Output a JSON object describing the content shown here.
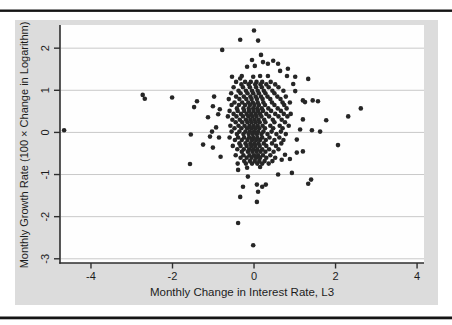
{
  "chart_data": {
    "type": "scatter",
    "title": "",
    "xlabel": "Monthly Change in Interest Rate, L3",
    "ylabel": "Monthly Growth Rate (100 × Change in Logarithm)",
    "xlim": [
      -4.76,
      4.17
    ],
    "ylim": [
      -3.1,
      2.55
    ],
    "xticks": [
      -4,
      -2,
      0,
      2,
      4
    ],
    "yticks": [
      -3,
      -2,
      -1,
      0,
      1,
      2
    ],
    "xtick_labels": [
      "-4",
      "-2",
      "0",
      "2",
      "4"
    ],
    "ytick_labels": [
      "-3",
      "-2",
      "-1",
      "0",
      "1",
      "2"
    ],
    "grid": "horizontal",
    "legend": "none",
    "colors": {
      "outer_bg": "#dcdcdc",
      "plot_bg": "#fefefe",
      "gridline": "#c9c9c9",
      "axis": "#2e2e2e",
      "marker": "#262626",
      "rule": "#141414",
      "text": "#1c1c1c"
    },
    "marker_radius": 2.3,
    "points": [
      [
        -4.66,
        0.05
      ],
      [
        -2.73,
        0.89
      ],
      [
        -2.68,
        0.8
      ],
      [
        -2.01,
        0.83
      ],
      [
        -1.57,
        -0.75
      ],
      [
        -1.55,
        -0.05
      ],
      [
        -1.47,
        0.6
      ],
      [
        -1.4,
        0.74
      ],
      [
        -1.25,
        -0.29
      ],
      [
        -1.13,
        0.36
      ],
      [
        -1.08,
        -0.1
      ],
      [
        -1.03,
        0.02
      ],
      [
        -1.01,
        -0.36
      ],
      [
        -1.01,
        0.62
      ],
      [
        -0.98,
        0.85
      ],
      [
        -0.93,
        0.12
      ],
      [
        -0.88,
        0.43
      ],
      [
        -0.86,
        -0.12
      ],
      [
        -0.84,
        0.55
      ],
      [
        -0.82,
        -0.58
      ],
      [
        0.0,
        2.42
      ],
      [
        -0.34,
        2.2
      ],
      [
        0.1,
        2.18
      ],
      [
        -0.78,
        1.96
      ],
      [
        0.17,
        1.84
      ],
      [
        -0.05,
        1.72
      ],
      [
        0.47,
        1.7
      ],
      [
        0.22,
        1.67
      ],
      [
        0.34,
        1.63
      ],
      [
        0.59,
        1.63
      ],
      [
        0.02,
        1.58
      ],
      [
        -0.17,
        1.56
      ],
      [
        0.83,
        1.51
      ],
      [
        0.64,
        1.46
      ],
      [
        -0.3,
        1.34
      ],
      [
        0.15,
        1.34
      ],
      [
        0.34,
        1.34
      ],
      [
        0.81,
        1.34
      ],
      [
        -0.54,
        1.32
      ],
      [
        -0.02,
        1.32
      ],
      [
        1.01,
        1.32
      ],
      [
        -0.34,
        1.28
      ],
      [
        1.33,
        1.27
      ],
      [
        0.96,
        1.15
      ],
      [
        1.2,
        0.76
      ],
      [
        1.44,
        0.76
      ],
      [
        1.57,
        0.74
      ],
      [
        1.25,
        0.72
      ],
      [
        1.01,
        0.98
      ],
      [
        1.2,
        0.31
      ],
      [
        1.77,
        0.29
      ],
      [
        2.31,
        0.38
      ],
      [
        2.62,
        0.57
      ],
      [
        1.13,
        0.07
      ],
      [
        1.42,
        0.05
      ],
      [
        1.62,
        0.02
      ],
      [
        1.05,
        -0.17
      ],
      [
        1.2,
        -0.45
      ],
      [
        1.05,
        -0.48
      ],
      [
        2.06,
        -0.3
      ],
      [
        0.93,
        -0.96
      ],
      [
        0.59,
        -1.0
      ],
      [
        0.88,
        -0.63
      ],
      [
        0.76,
        -0.53
      ],
      [
        0.68,
        -0.65
      ],
      [
        0.15,
        -0.82
      ],
      [
        -0.39,
        -0.89
      ],
      [
        -0.17,
        -0.84
      ],
      [
        -0.15,
        -1.05
      ],
      [
        0.07,
        -1.24
      ],
      [
        0.29,
        -1.24
      ],
      [
        -0.27,
        -1.29
      ],
      [
        0.2,
        -1.29
      ],
      [
        0.1,
        -1.41
      ],
      [
        -0.34,
        -1.53
      ],
      [
        0.07,
        -1.65
      ],
      [
        1.33,
        -1.22
      ],
      [
        1.4,
        -1.12
      ],
      [
        -0.39,
        -2.15
      ],
      [
        -0.02,
        -2.68
      ]
    ],
    "cluster_rows": [
      {
        "y": 1.2,
        "xs": [
          -0.44,
          -0.22,
          -0.08,
          0.06,
          0.2,
          0.41
        ]
      },
      {
        "y": 1.14,
        "xs": [
          -0.31,
          -0.13,
          0.03,
          0.16,
          0.3,
          0.52
        ]
      },
      {
        "y": 1.07,
        "xs": [
          -0.5,
          -0.27,
          -0.1,
          0.05,
          0.19,
          0.36,
          0.6
        ]
      },
      {
        "y": 0.99,
        "xs": [
          -0.38,
          -0.2,
          -0.05,
          0.09,
          0.24,
          0.45,
          0.72
        ]
      },
      {
        "y": 0.93,
        "xs": [
          -0.56,
          -0.33,
          -0.16,
          -0.02,
          0.12,
          0.28,
          0.5
        ]
      },
      {
        "y": 0.85,
        "xs": [
          -0.44,
          -0.25,
          -0.09,
          0.04,
          0.17,
          0.33,
          0.57,
          0.78
        ]
      },
      {
        "y": 0.79,
        "xs": [
          -0.62,
          -0.36,
          -0.19,
          -0.06,
          0.07,
          0.21,
          0.4,
          0.65
        ]
      },
      {
        "y": 0.71,
        "xs": [
          -0.48,
          -0.29,
          -0.14,
          -0.03,
          0.09,
          0.23,
          0.44,
          0.7,
          0.88
        ]
      },
      {
        "y": 0.65,
        "xs": [
          -0.55,
          -0.37,
          -0.22,
          -0.1,
          0.01,
          0.12,
          0.27,
          0.5,
          0.74
        ]
      },
      {
        "y": 0.57,
        "xs": [
          -0.42,
          -0.26,
          -0.13,
          -0.02,
          0.08,
          0.19,
          0.35,
          0.58,
          0.8
        ]
      },
      {
        "y": 0.51,
        "xs": [
          -0.6,
          -0.4,
          -0.24,
          -0.12,
          -0.01,
          0.1,
          0.22,
          0.42,
          0.66
        ]
      },
      {
        "y": 0.44,
        "xs": [
          -0.5,
          -0.32,
          -0.18,
          -0.07,
          0.04,
          0.15,
          0.3,
          0.52,
          0.73,
          0.9
        ]
      },
      {
        "y": 0.38,
        "xs": [
          -0.64,
          -0.43,
          -0.27,
          -0.14,
          -0.04,
          0.06,
          0.18,
          0.37,
          0.6,
          0.82
        ]
      },
      {
        "y": 0.3,
        "xs": [
          -0.53,
          -0.35,
          -0.2,
          -0.09,
          0.01,
          0.11,
          0.25,
          0.46,
          0.68
        ]
      },
      {
        "y": 0.24,
        "xs": [
          -0.45,
          -0.29,
          -0.16,
          -0.06,
          0.04,
          0.14,
          0.28,
          0.5,
          0.76
        ]
      },
      {
        "y": 0.16,
        "xs": [
          -0.58,
          -0.38,
          -0.23,
          -0.11,
          -0.01,
          0.09,
          0.21,
          0.4,
          0.63,
          0.85
        ]
      },
      {
        "y": 0.1,
        "xs": [
          -0.48,
          -0.31,
          -0.17,
          -0.07,
          0.03,
          0.13,
          0.27,
          0.47,
          0.7
        ]
      },
      {
        "y": 0.02,
        "xs": [
          -0.55,
          -0.36,
          -0.21,
          -0.1,
          0.0,
          0.1,
          0.23,
          0.43,
          0.66
        ]
      },
      {
        "y": -0.04,
        "xs": [
          -0.42,
          -0.26,
          -0.13,
          -0.03,
          0.07,
          0.18,
          0.33,
          0.55,
          0.78
        ]
      },
      {
        "y": -0.12,
        "xs": [
          -0.6,
          -0.39,
          -0.24,
          -0.12,
          -0.02,
          0.08,
          0.2,
          0.38,
          0.62
        ]
      },
      {
        "y": -0.18,
        "xs": [
          -0.47,
          -0.3,
          -0.16,
          -0.05,
          0.05,
          0.15,
          0.29,
          0.5,
          0.72
        ]
      },
      {
        "y": -0.26,
        "xs": [
          -0.36,
          -0.21,
          -0.09,
          0.01,
          0.11,
          0.24,
          0.44,
          0.67
        ]
      },
      {
        "y": -0.32,
        "xs": [
          -0.52,
          -0.33,
          -0.18,
          -0.07,
          0.03,
          0.14,
          0.3,
          0.54
        ]
      },
      {
        "y": -0.4,
        "xs": [
          -0.41,
          -0.25,
          -0.12,
          -0.02,
          0.08,
          0.2,
          0.37,
          0.6
        ]
      },
      {
        "y": -0.46,
        "xs": [
          -0.3,
          -0.15,
          -0.04,
          0.06,
          0.16,
          0.28,
          0.48
        ]
      },
      {
        "y": -0.54,
        "xs": [
          -0.45,
          -0.26,
          -0.11,
          0.0,
          0.1,
          0.22,
          0.4
        ]
      },
      {
        "y": -0.6,
        "xs": [
          -0.33,
          -0.18,
          -0.06,
          0.05,
          0.15,
          0.3,
          0.52
        ]
      },
      {
        "y": -0.68,
        "xs": [
          -0.24,
          -0.1,
          0.02,
          0.13,
          0.26,
          0.45
        ]
      },
      {
        "y": -0.74,
        "xs": [
          -0.4,
          -0.2,
          -0.05,
          0.08,
          0.2,
          0.36
        ]
      }
    ]
  }
}
